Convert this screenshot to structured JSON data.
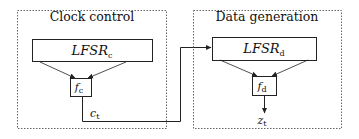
{
  "diagram": {
    "groups": [
      {
        "id": "clock-control",
        "title": "Clock control",
        "lfsr": {
          "base": "LFSR",
          "sub": "c"
        },
        "func": {
          "base": "f",
          "sub": "c"
        },
        "output": {
          "base": "c",
          "sub": "t"
        }
      },
      {
        "id": "data-generation",
        "title": "Data generation",
        "lfsr": {
          "base": "LFSR",
          "sub": "d"
        },
        "func": {
          "base": "f",
          "sub": "d"
        },
        "output": {
          "base": "z",
          "sub": "t"
        }
      }
    ],
    "colors": {
      "stroke": "#222222",
      "dashed": "#666666",
      "background": "#ffffff"
    }
  }
}
